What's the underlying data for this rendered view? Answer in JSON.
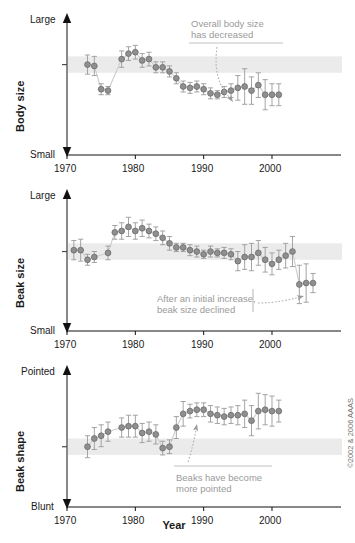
{
  "figure": {
    "xaxis_title": "Year",
    "copyright": "©2002 & 2006 AAAS"
  },
  "chart_data": [
    {
      "id": "body-size",
      "type": "scatter",
      "title": "",
      "ylabel": "Body size",
      "xlabel": "Year",
      "y_top_label": "Large",
      "y_bottom_label": "Small",
      "ylim": [
        0,
        100
      ],
      "xlim": [
        1969,
        2007
      ],
      "xticks": [
        1970,
        1980,
        1990,
        2000
      ],
      "grid": false,
      "reference_band": [
        60,
        72
      ],
      "annotation": "Overall body size has decreased",
      "annotation_lines": [
        "Overall body size",
        "has decreased"
      ],
      "marker_color": "#8f8f8f",
      "error_color": "#9a9a9a",
      "x": [
        1973,
        1974,
        1975,
        1976,
        1978,
        1979,
        1980,
        1981,
        1982,
        1983,
        1984,
        1985,
        1986,
        1987,
        1988,
        1989,
        1990,
        1991,
        1992,
        1993,
        1994,
        1995,
        1996,
        1997,
        1998,
        1999,
        2000,
        2001
      ],
      "values": [
        66,
        65,
        48,
        47,
        70,
        74,
        75,
        69,
        70,
        64,
        64,
        61,
        56,
        50,
        49,
        50,
        48,
        45,
        44,
        46,
        47,
        49,
        50,
        47,
        51,
        44,
        44,
        44
      ],
      "errors": [
        7,
        7,
        4,
        3,
        6,
        5,
        5,
        5,
        5,
        4,
        4,
        4,
        4,
        4,
        4,
        4,
        4,
        4,
        3,
        4,
        5,
        9,
        13,
        10,
        9,
        11,
        8,
        8
      ]
    },
    {
      "id": "beak-size",
      "type": "scatter",
      "title": "",
      "ylabel": "Beak size",
      "xlabel": "Year",
      "y_top_label": "Large",
      "y_bottom_label": "Small",
      "ylim": [
        0,
        100
      ],
      "xlim": [
        1969,
        2007
      ],
      "xticks": [
        1970,
        1980,
        1990,
        2000
      ],
      "grid": false,
      "reference_band": [
        52,
        64
      ],
      "annotation": "After an initial increase, beak size declined",
      "annotation_lines": [
        "After an initial increase,",
        "beak size declined"
      ],
      "marker_color": "#8f8f8f",
      "error_color": "#9a9a9a",
      "x": [
        1971,
        1972,
        1973,
        1974,
        1976,
        1977,
        1978,
        1979,
        1980,
        1981,
        1982,
        1983,
        1984,
        1985,
        1986,
        1987,
        1988,
        1989,
        1990,
        1991,
        1992,
        1993,
        1994,
        1995,
        1996,
        1997,
        1998,
        1999,
        2000,
        2001,
        2002,
        2003,
        2004,
        2005,
        2006
      ],
      "values": [
        59,
        59,
        52,
        54,
        57,
        72,
        73,
        76,
        73,
        75,
        73,
        71,
        68,
        64,
        61,
        61,
        59,
        58,
        56,
        58,
        57,
        57,
        56,
        51,
        54,
        54,
        57,
        52,
        49,
        52,
        55,
        58,
        34,
        35,
        35
      ],
      "errors": [
        7,
        8,
        4,
        4,
        5,
        5,
        6,
        7,
        6,
        6,
        5,
        5,
        5,
        5,
        3,
        3,
        4,
        4,
        3,
        4,
        3,
        4,
        4,
        7,
        9,
        10,
        9,
        9,
        8,
        7,
        9,
        11,
        14,
        14,
        7
      ]
    },
    {
      "id": "beak-shape",
      "type": "scatter",
      "title": "",
      "ylabel": "Beak shape",
      "xlabel": "Year",
      "y_top_label": "Pointed",
      "y_bottom_label": "Blunt",
      "ylim": [
        0,
        100
      ],
      "xlim": [
        1969,
        2007
      ],
      "xticks": [
        1970,
        1980,
        1990,
        2000
      ],
      "grid": false,
      "reference_band": [
        38,
        50
      ],
      "annotation": "Beaks have become more pointed",
      "annotation_lines": [
        "Beaks have become",
        "more pointed"
      ],
      "marker_color": "#8f8f8f",
      "error_color": "#9a9a9a",
      "x": [
        1973,
        1974,
        1975,
        1976,
        1978,
        1979,
        1980,
        1981,
        1982,
        1983,
        1984,
        1985,
        1986,
        1987,
        1988,
        1989,
        1990,
        1991,
        1992,
        1993,
        1994,
        1995,
        1996,
        1997,
        1998,
        1999,
        2000,
        2001
      ],
      "values": [
        44,
        50,
        52,
        55,
        58,
        59,
        59,
        54,
        55,
        53,
        43,
        44,
        58,
        68,
        70,
        71,
        71,
        68,
        67,
        66,
        67,
        67,
        68,
        63,
        70,
        71,
        70,
        70
      ],
      "errors": [
        8,
        8,
        8,
        7,
        7,
        8,
        8,
        7,
        7,
        7,
        5,
        5,
        8,
        9,
        5,
        5,
        5,
        6,
        6,
        6,
        6,
        7,
        10,
        11,
        13,
        11,
        11,
        8
      ]
    }
  ]
}
